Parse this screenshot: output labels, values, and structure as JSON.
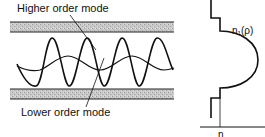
{
  "figure": {
    "left_panel": {
      "title": "Optical fiber mode propagation",
      "labels": {
        "higher_mode": "Higher order mode",
        "lower_mode": "Lower order mode"
      },
      "cladding_color": "#bdbdbd"
    },
    "right_panel": {
      "title": "Graded refractive index profile",
      "labels": {
        "profile": "n₁(ρ)",
        "axis": "n"
      }
    }
  }
}
